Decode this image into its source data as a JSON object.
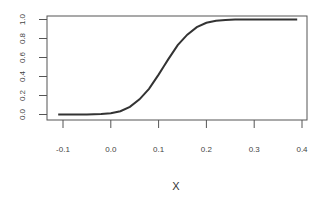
{
  "chart_data": {
    "type": "line",
    "title": "",
    "xlabel": "X",
    "ylabel": "",
    "xlim": [
      -0.12,
      0.41
    ],
    "ylim": [
      -0.02,
      1.04
    ],
    "grid": false,
    "legend": null,
    "x_ticks": [
      "-0.1",
      "0.0",
      "0.1",
      "0.2",
      "0.3",
      "0.4"
    ],
    "y_ticks": [
      "0.0",
      "0.2",
      "0.4",
      "0.6",
      "0.8",
      "1.0"
    ],
    "series": [
      {
        "name": "cdf",
        "color": "#333333",
        "x": [
          -0.11,
          -0.08,
          -0.05,
          -0.02,
          0.0,
          0.02,
          0.04,
          0.06,
          0.08,
          0.1,
          0.11,
          0.12,
          0.14,
          0.16,
          0.18,
          0.2,
          0.22,
          0.24,
          0.26,
          0.3,
          0.35,
          0.39
        ],
        "y": [
          0.0,
          0.0,
          0.001,
          0.005,
          0.014,
          0.035,
          0.08,
          0.16,
          0.27,
          0.42,
          0.5,
          0.58,
          0.73,
          0.84,
          0.92,
          0.965,
          0.986,
          0.995,
          0.999,
          1.0,
          1.0,
          1.0
        ]
      }
    ]
  }
}
